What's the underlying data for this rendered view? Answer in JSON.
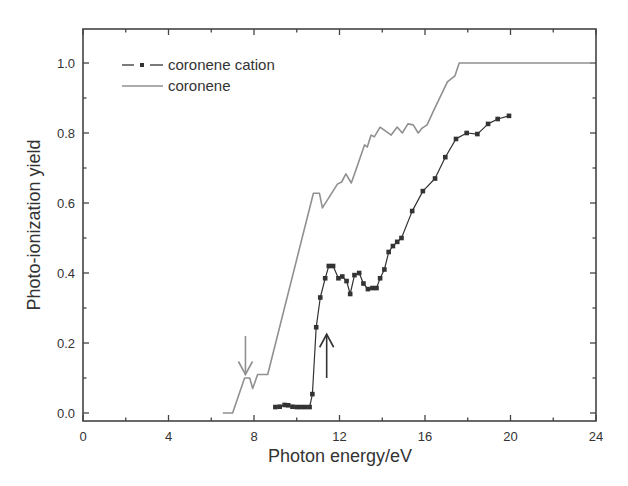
{
  "chart_data": {
    "type": "line",
    "title": "",
    "xlabel": "Photon energy/eV",
    "ylabel": "Photo-ionization yield",
    "xlim": [
      0,
      24
    ],
    "ylim": [
      -0.02,
      1.1
    ],
    "xticks": [
      0,
      4,
      8,
      12,
      16,
      20,
      24
    ],
    "xtick_labels": [
      "0",
      "4",
      "8",
      "12",
      "16",
      "20",
      "24"
    ],
    "yticks": [
      0.0,
      0.2,
      0.4,
      0.6,
      0.8,
      1.0
    ],
    "ytick_labels": [
      "0.0",
      "0.2",
      "0.4",
      "0.6",
      "0.8",
      "1.0"
    ],
    "grid": false,
    "legend_position": "upper left",
    "series": [
      {
        "name": "coronene cation",
        "style": "line with square markers",
        "color": "#333333",
        "x": [
          9.0,
          9.2,
          9.43,
          9.6,
          9.8,
          10.0,
          10.2,
          10.4,
          10.6,
          10.73,
          10.91,
          11.1,
          11.33,
          11.5,
          11.7,
          11.95,
          12.13,
          12.33,
          12.5,
          12.7,
          12.92,
          13.12,
          13.33,
          13.54,
          13.73,
          13.9,
          14.1,
          14.3,
          14.5,
          14.7,
          14.9,
          15.4,
          15.9,
          16.47,
          16.95,
          17.45,
          17.95,
          18.45,
          18.95,
          19.4,
          19.93
        ],
        "y": [
          0.017,
          0.018,
          0.023,
          0.022,
          0.018,
          0.017,
          0.017,
          0.017,
          0.017,
          0.054,
          0.245,
          0.33,
          0.385,
          0.42,
          0.42,
          0.385,
          0.39,
          0.377,
          0.34,
          0.394,
          0.4,
          0.37,
          0.354,
          0.357,
          0.357,
          0.385,
          0.41,
          0.46,
          0.477,
          0.489,
          0.5,
          0.577,
          0.634,
          0.67,
          0.731,
          0.783,
          0.8,
          0.797,
          0.826,
          0.84,
          0.849
        ]
      },
      {
        "name": "coronene",
        "style": "line",
        "color": "#909090",
        "x": [
          6.54,
          7.0,
          7.56,
          7.8,
          7.94,
          8.17,
          8.64,
          10.78,
          11.06,
          11.2,
          11.9,
          12.1,
          12.3,
          12.55,
          12.8,
          13.17,
          13.3,
          13.48,
          13.63,
          13.9,
          14.42,
          14.7,
          14.94,
          15.2,
          15.45,
          15.68,
          15.87,
          16.1,
          16.4,
          17.05,
          17.4,
          17.6,
          24.0
        ],
        "y": [
          0.0,
          0.0,
          0.1,
          0.1,
          0.07,
          0.11,
          0.11,
          0.628,
          0.628,
          0.586,
          0.654,
          0.66,
          0.683,
          0.657,
          0.7,
          0.766,
          0.76,
          0.794,
          0.789,
          0.817,
          0.794,
          0.817,
          0.8,
          0.826,
          0.823,
          0.8,
          0.814,
          0.823,
          0.863,
          0.946,
          0.963,
          1.0,
          1.0
        ]
      }
    ],
    "annotations": [
      {
        "type": "arrow",
        "direction": "down",
        "x": 7.6,
        "y_from": 0.22,
        "y_to": 0.11,
        "color": "#909090",
        "target": "coronene onset"
      },
      {
        "type": "arrow",
        "direction": "up",
        "x": 11.4,
        "y_from": 0.1,
        "y_to": 0.225,
        "color": "#333333",
        "target": "coronene cation onset"
      }
    ]
  },
  "legend": {
    "items": [
      {
        "label": "coronene cation"
      },
      {
        "label": "coronene"
      }
    ]
  },
  "axes": {
    "xlabel": "Photon energy/eV",
    "ylabel": "Photo-ionization yield"
  }
}
